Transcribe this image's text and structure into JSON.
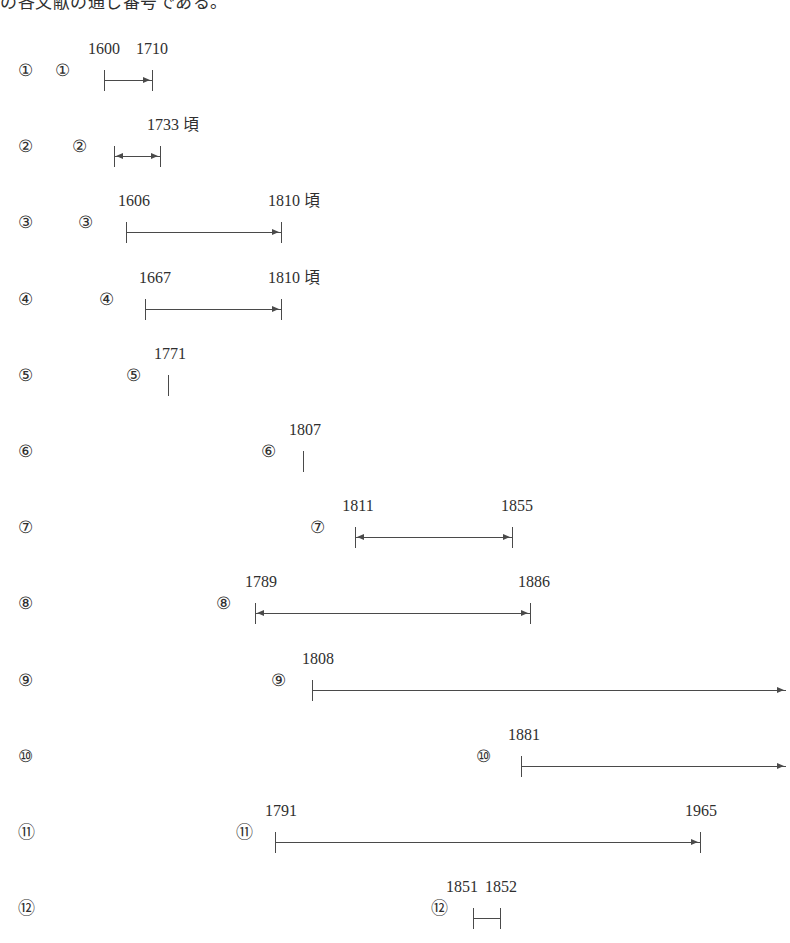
{
  "caption": {
    "text": "の各文献の通し番号である。"
  },
  "diagram": {
    "type": "timeline-ranges",
    "row_count": 12,
    "line_color": "#4a4a4a",
    "text_color": "#2f2f2f",
    "rows": [
      {
        "index_label": "①",
        "marker_label": "①",
        "marker_x": 55,
        "bar_start_x": 104,
        "bar_end_x": 152,
        "start_cap": "tick",
        "end_cap": "arrow-tick",
        "labels": [
          {
            "text": "1600",
            "x": 104
          },
          {
            "text": "1710",
            "x": 152
          }
        ]
      },
      {
        "index_label": "②",
        "marker_label": "②",
        "marker_x": 72,
        "bar_start_x": 114,
        "bar_end_x": 160,
        "start_cap": "arrow-tick-left",
        "end_cap": "arrow-tick",
        "labels": [
          {
            "text": "1733 頃",
            "x": 173
          }
        ]
      },
      {
        "index_label": "③",
        "marker_label": "③",
        "marker_x": 78,
        "bar_start_x": 126,
        "bar_end_x": 281,
        "start_cap": "tick",
        "end_cap": "arrow-tick",
        "labels": [
          {
            "text": "1606",
            "x": 134
          },
          {
            "text": "1810 頃",
            "x": 294
          }
        ]
      },
      {
        "index_label": "④",
        "marker_label": "④",
        "marker_x": 99,
        "bar_start_x": 145,
        "bar_end_x": 281,
        "start_cap": "tick",
        "end_cap": "arrow-tick",
        "labels": [
          {
            "text": "1667",
            "x": 155
          },
          {
            "text": "1810 頃",
            "x": 294
          }
        ]
      },
      {
        "index_label": "⑤",
        "marker_label": "⑤",
        "marker_x": 126,
        "bar_start_x": 168,
        "bar_end_x": 168,
        "start_cap": "tick",
        "end_cap": "none",
        "labels": [
          {
            "text": "1771",
            "x": 170
          }
        ]
      },
      {
        "index_label": "⑥",
        "marker_label": "⑥",
        "marker_x": 261,
        "bar_start_x": 303,
        "bar_end_x": 303,
        "start_cap": "tick",
        "end_cap": "none",
        "labels": [
          {
            "text": "1807",
            "x": 305
          }
        ]
      },
      {
        "index_label": "⑦",
        "marker_label": "⑦",
        "marker_x": 310,
        "bar_start_x": 355,
        "bar_end_x": 512,
        "start_cap": "arrow-tick-left",
        "end_cap": "arrow-tick",
        "labels": [
          {
            "text": "1811",
            "x": 358
          },
          {
            "text": "1855",
            "x": 517
          }
        ]
      },
      {
        "index_label": "⑧",
        "marker_label": "⑧",
        "marker_x": 216,
        "bar_start_x": 255,
        "bar_end_x": 530,
        "start_cap": "arrow-tick-left",
        "end_cap": "arrow-tick",
        "labels": [
          {
            "text": "1789",
            "x": 261
          },
          {
            "text": "1886",
            "x": 534
          }
        ]
      },
      {
        "index_label": "⑨",
        "marker_label": "⑨",
        "marker_x": 271,
        "bar_start_x": 312,
        "bar_end_x": 786,
        "start_cap": "tick",
        "end_cap": "arrow-open",
        "labels": [
          {
            "text": "1808",
            "x": 318
          }
        ]
      },
      {
        "index_label": "⑩",
        "marker_label": "⑩",
        "marker_x": 476,
        "bar_start_x": 521,
        "bar_end_x": 786,
        "start_cap": "tick",
        "end_cap": "arrow-open",
        "labels": [
          {
            "text": "1881",
            "x": 524
          }
        ]
      },
      {
        "index_label": "⑪",
        "marker_label": "⑪",
        "marker_x": 236,
        "bar_start_x": 275,
        "bar_end_x": 700,
        "start_cap": "tick",
        "end_cap": "arrow-tick",
        "labels": [
          {
            "text": "1791",
            "x": 281
          },
          {
            "text": "1965",
            "x": 701
          }
        ]
      },
      {
        "index_label": "⑫",
        "marker_label": "⑫",
        "marker_x": 431,
        "bar_start_x": 473,
        "bar_end_x": 500,
        "start_cap": "tick",
        "end_cap": "tick",
        "labels": [
          {
            "text": "1851",
            "x": 462
          },
          {
            "text": "1852",
            "x": 501
          }
        ]
      }
    ]
  }
}
